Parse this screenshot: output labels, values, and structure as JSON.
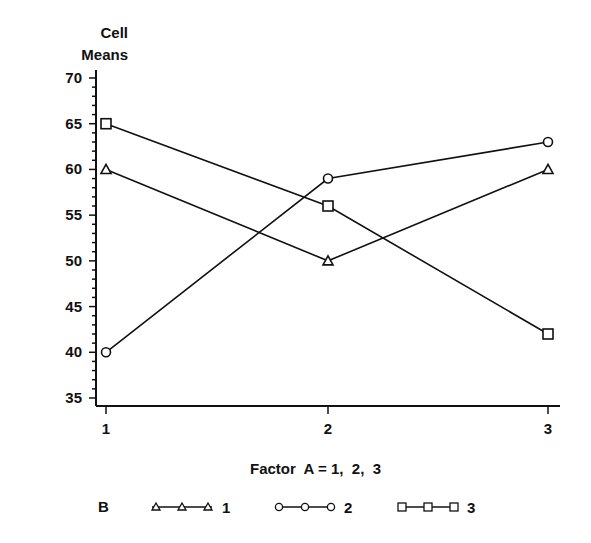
{
  "chart_data": {
    "type": "line",
    "title": "",
    "ylabel": [
      "Cell",
      "Means"
    ],
    "xlabel": "Factor  A = 1,  2,  3",
    "x": [
      1,
      2,
      3
    ],
    "xticks": [
      "1",
      "2",
      "3"
    ],
    "ylim": [
      35,
      70
    ],
    "yticks": [
      35,
      40,
      45,
      50,
      55,
      60,
      65,
      70
    ],
    "ytick_minor_step": 1,
    "grid": false,
    "legend": {
      "title": "B",
      "position": "bottom"
    },
    "series": [
      {
        "name": "1",
        "marker": "triangle",
        "values": [
          60,
          50,
          60
        ]
      },
      {
        "name": "2",
        "marker": "circle",
        "values": [
          40,
          59,
          63
        ]
      },
      {
        "name": "3",
        "marker": "square",
        "values": [
          65,
          56,
          42
        ]
      }
    ]
  },
  "labels": {
    "y_title_line1": "Cell",
    "y_title_line2": "Means",
    "x_title": "Factor  A = 1,  2,  3",
    "legend_title": "B",
    "legend_1": "1",
    "legend_2": "2",
    "legend_3": "3"
  }
}
